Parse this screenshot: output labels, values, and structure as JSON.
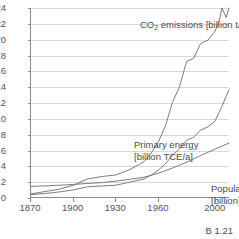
{
  "figure": {
    "number_label": "B 1.21",
    "axis_color": "#8c8c8c",
    "grid_color": "#d8d8d8",
    "line_color": "#6e6e6e"
  },
  "annotations": {
    "co2_line1": "CO",
    "co2_sub": "2",
    "co2_line2": " emissions  [billion t/a]",
    "energy_line1": "Primary energy",
    "energy_line2": "[billion TCE/a]",
    "population_line1": "Population",
    "population_line2": "[billion]"
  },
  "chart_data": {
    "type": "line",
    "title": "",
    "xlabel": "",
    "ylabel": "",
    "xlim": [
      1870,
      2010
    ],
    "ylim": [
      0,
      24
    ],
    "grid": "horizontal",
    "legend": "inline-annotations",
    "xticks": [
      1870,
      1900,
      1930,
      1960,
      2000
    ],
    "xtick_labels": [
      "1870",
      "1900",
      "1930",
      "1960",
      "2000"
    ],
    "yticks": [
      0,
      2,
      4,
      6,
      8,
      10,
      12,
      14,
      16,
      18,
      20,
      22,
      24
    ],
    "ytick_labels": [
      "0",
      "2",
      "4",
      "6",
      "8",
      "10",
      "12",
      "14",
      "16",
      "18",
      "20",
      "22",
      "24"
    ],
    "series": [
      {
        "name": "CO2 emissions [billion t/a]",
        "unit": "billion t/a",
        "x": [
          1870,
          1880,
          1890,
          1900,
          1910,
          1920,
          1930,
          1940,
          1950,
          1955,
          1960,
          1965,
          1970,
          1975,
          1980,
          1985,
          1990,
          1995,
          2000,
          2003,
          2005,
          2008,
          2010
        ],
        "values": [
          0.4,
          0.7,
          1.0,
          1.5,
          2.3,
          2.6,
          2.8,
          3.5,
          4.5,
          5.6,
          7.0,
          9.0,
          12.0,
          14.0,
          17.2,
          17.6,
          19.5,
          19.9,
          21.0,
          22.3,
          24.0,
          22.8,
          24.0
        ]
      },
      {
        "name": "Primary energy [billion TCE/a]",
        "unit": "billion TCE/a",
        "x": [
          1870,
          1880,
          1890,
          1900,
          1910,
          1920,
          1930,
          1940,
          1950,
          1955,
          1960,
          1965,
          1970,
          1975,
          1980,
          1985,
          1990,
          1995,
          2000,
          2005,
          2010
        ],
        "values": [
          0.3,
          0.45,
          0.65,
          0.9,
          1.3,
          1.4,
          1.5,
          1.9,
          2.3,
          2.8,
          3.4,
          4.2,
          5.3,
          6.1,
          7.2,
          7.6,
          8.5,
          8.9,
          9.6,
          11.5,
          13.6
        ]
      },
      {
        "name": "Population [billion]",
        "unit": "billion",
        "x": [
          1870,
          1880,
          1890,
          1900,
          1910,
          1920,
          1930,
          1940,
          1950,
          1960,
          1970,
          1980,
          1990,
          2000,
          2010
        ],
        "values": [
          1.35,
          1.42,
          1.5,
          1.6,
          1.72,
          1.83,
          2.02,
          2.25,
          2.52,
          3.02,
          3.68,
          4.42,
          5.27,
          6.08,
          6.85
        ]
      }
    ]
  }
}
